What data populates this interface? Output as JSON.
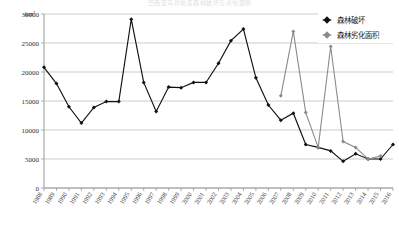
{
  "figure": {
    "cropped_title": "巴西亚马孙地区森林破坏与劣化面积",
    "unit_label": "km²"
  },
  "legend": {
    "position": "top-right",
    "items": [
      {
        "label": "森林破坏",
        "marker": "filled-diamond",
        "color": "#111111"
      },
      {
        "label": "森林劣化面积",
        "marker": "filled-diamond",
        "color": "#8b8b8b"
      }
    ]
  },
  "chart_data": {
    "type": "line",
    "title": "",
    "xlabel": "",
    "ylabel": "km²",
    "ylim": [
      0,
      30000
    ],
    "ytick_step": 5000,
    "yticks": [
      "0",
      "5000",
      "10000",
      "15000",
      "20000",
      "25000",
      "30000"
    ],
    "grid": true,
    "legend_position": "top-right",
    "categories": [
      "1988",
      "1989",
      "1990",
      "1991",
      "1992",
      "1993",
      "1994",
      "1995",
      "1996",
      "1997",
      "1998",
      "1999",
      "2000",
      "2001",
      "2002",
      "2003",
      "2004",
      "2005",
      "2006",
      "2007",
      "2008",
      "2009",
      "2010",
      "2011",
      "2012",
      "2013",
      "2014",
      "2015",
      "2016"
    ],
    "series": [
      {
        "name": "森林破坏",
        "color": "#111111",
        "marker": "filled-diamond",
        "values": [
          20800,
          18000,
          14000,
          11200,
          13900,
          14900,
          14900,
          29100,
          18200,
          13200,
          17400,
          17300,
          18200,
          18200,
          21500,
          25400,
          27400,
          19000,
          14300,
          11700,
          12900,
          7500,
          7000,
          6400,
          4600,
          5900,
          5000,
          5000,
          7500
        ]
      },
      {
        "name": "森林劣化面积",
        "color": "#8b8b8b",
        "marker": "filled-diamond",
        "values": [
          null,
          null,
          null,
          null,
          null,
          null,
          null,
          null,
          null,
          null,
          null,
          null,
          null,
          null,
          null,
          null,
          null,
          null,
          null,
          15900,
          27000,
          13000,
          7000,
          24400,
          8000,
          7000,
          5000,
          5500,
          null
        ]
      }
    ]
  }
}
